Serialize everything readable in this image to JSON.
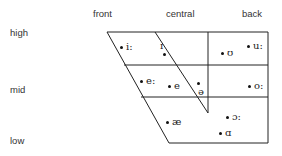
{
  "columns": {
    "front": "front",
    "central": "central",
    "back": "back"
  },
  "rows": {
    "high": "high",
    "mid": "mid",
    "low": "low"
  },
  "vowels": {
    "i_long": "i:",
    "I": "ɪ",
    "u_short": "ʊ",
    "u_long": "u:",
    "e_long": "e:",
    "e": "e",
    "schwa": "ə",
    "o_long": "o:",
    "ae": "æ",
    "open_o_long": "ɔ:",
    "a": "ɑ"
  },
  "colors": {
    "line": "#222222",
    "text": "#333333"
  }
}
